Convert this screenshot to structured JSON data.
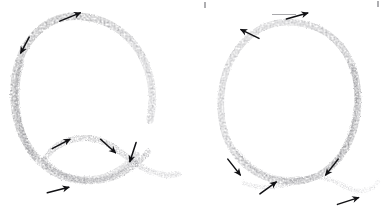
{
  "image": {
    "title": "Handwriting stroke-direction diagram: two letter Q forms",
    "media": "pencil on paper, scanned",
    "background_color": "#ffffff",
    "width": 386,
    "height": 215
  },
  "palette": {
    "paper": "#ffffff",
    "pencil_dark": "#6e6e70",
    "pencil_mid": "#8e8e91",
    "pencil_light": "#b4b4b7",
    "pencil_faint": "#cfcfd2",
    "arrow_ink": "#111114",
    "stray_mark": "#9a9a9d"
  },
  "figures": [
    {
      "id": "left-q",
      "label": "Q",
      "description": "Large open bowl with a wavy tail crossing the bowl at lower right",
      "bowl": {
        "center_x": 86,
        "center_y": 92,
        "radius_x": 72,
        "radius_y": 76,
        "gap_at": "lower-right",
        "heaviest_side": "left"
      },
      "tail": {
        "description": "S-curve tail starting inside lower bowl, rising, then sweeping down-right past the bowl edge",
        "start_x": 46,
        "start_y": 156,
        "end_x": 178,
        "end_y": 176
      },
      "arrows": [
        {
          "name": "arrow-top-right",
          "x": 70,
          "y": 17,
          "angle": -22,
          "length": 22,
          "direction": "right-up"
        },
        {
          "name": "arrow-upper-left",
          "x": 25,
          "y": 45,
          "angle": 118,
          "length": 18,
          "direction": "down-left"
        },
        {
          "name": "arrow-tail-start",
          "x": 61,
          "y": 144,
          "angle": -28,
          "length": 20,
          "direction": "up-right"
        },
        {
          "name": "arrow-tail-crest",
          "x": 108,
          "y": 146,
          "angle": 42,
          "length": 20,
          "direction": "down-right"
        },
        {
          "name": "arrow-bowl-descend",
          "x": 133,
          "y": 152,
          "angle": 108,
          "length": 20,
          "direction": "down-left"
        },
        {
          "name": "arrow-bottom-left",
          "x": 58,
          "y": 190,
          "angle": -14,
          "length": 22,
          "direction": "right"
        }
      ]
    },
    {
      "id": "right-q",
      "label": "Q",
      "description": "Rounder closed bowl with a faint flat tail crossing at the bottom",
      "bowl": {
        "center_x": 289,
        "center_y": 99,
        "radius_x": 68,
        "radius_y": 77,
        "gap_at": "lower-right",
        "heaviest_side": "right"
      },
      "tail": {
        "description": "Low, nearly flat tail crossing under the bowl and curving up to the right",
        "start_x": 244,
        "start_y": 182,
        "end_x": 378,
        "end_y": 183
      },
      "arrows": [
        {
          "name": "arrow-top-right",
          "x": 297,
          "y": 16,
          "angle": -16,
          "length": 22,
          "direction": "right-up"
        },
        {
          "name": "arrow-upper-left",
          "x": 250,
          "y": 34,
          "angle": 206,
          "length": 20,
          "direction": "up-left"
        },
        {
          "name": "arrow-lower-left",
          "x": 234,
          "y": 167,
          "angle": 52,
          "length": 20,
          "direction": "down-right"
        },
        {
          "name": "arrow-lower-right",
          "x": 332,
          "y": 167,
          "angle": 128,
          "length": 20,
          "direction": "down-left"
        },
        {
          "name": "arrow-tail-left",
          "x": 268,
          "y": 188,
          "angle": -36,
          "length": 20,
          "direction": "up-right"
        },
        {
          "name": "arrow-tail-right",
          "x": 348,
          "y": 201,
          "angle": -18,
          "length": 22,
          "direction": "right-up"
        }
      ]
    }
  ],
  "stray_marks": [
    {
      "name": "stray-mark-top-center",
      "x": 205,
      "y": 2,
      "width": 2,
      "height": 6
    },
    {
      "name": "stray-rule-top",
      "x": 284,
      "y": 14,
      "width": 24,
      "height": 1
    },
    {
      "name": "stray-mark-top-right",
      "x": 378,
      "y": 1,
      "width": 2,
      "height": 6
    }
  ]
}
